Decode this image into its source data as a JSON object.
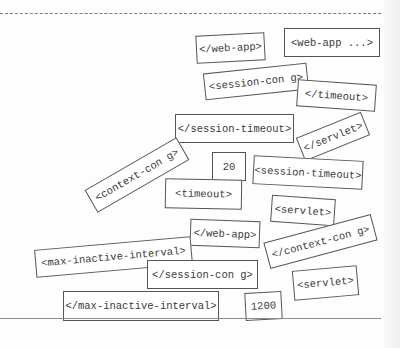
{
  "page": {
    "background": "#fdfdfd",
    "top_divider": "dashed",
    "bottom_divider": "solid"
  },
  "magnets": [
    {
      "id": "m1",
      "label": "</web-app>",
      "x": 196,
      "y": 34,
      "w": 69,
      "h": 28,
      "rotate": -3
    },
    {
      "id": "m2",
      "label": "<web-app ...>",
      "x": 284,
      "y": 28,
      "w": 96,
      "h": 29,
      "rotate": 0
    },
    {
      "id": "m3",
      "label": "<session-con g>",
      "x": 204,
      "y": 68,
      "w": 104,
      "h": 27,
      "rotate": -6
    },
    {
      "id": "m4",
      "label": "</timeout>",
      "x": 297,
      "y": 82,
      "w": 79,
      "h": 27,
      "rotate": 4
    },
    {
      "id": "m5",
      "label": "</session-timeout>",
      "x": 175,
      "y": 114,
      "w": 119,
      "h": 29,
      "rotate": 0
    },
    {
      "id": "m6",
      "label": "</servlet>",
      "x": 298,
      "y": 124,
      "w": 70,
      "h": 25,
      "rotate": -22
    },
    {
      "id": "m7",
      "label": "<context-con g>",
      "x": 84,
      "y": 162,
      "w": 106,
      "h": 26,
      "rotate": -30
    },
    {
      "id": "m8",
      "label": "20",
      "x": 212,
      "y": 152,
      "w": 34,
      "h": 29,
      "rotate": 0
    },
    {
      "id": "m9",
      "label": "<session-timeout>",
      "x": 253,
      "y": 158,
      "w": 110,
      "h": 29,
      "rotate": 3
    },
    {
      "id": "m10",
      "label": "<timeout>",
      "x": 165,
      "y": 179,
      "w": 77,
      "h": 30,
      "rotate": 1
    },
    {
      "id": "m11",
      "label": "<servlet>",
      "x": 271,
      "y": 197,
      "w": 64,
      "h": 27,
      "rotate": 4
    },
    {
      "id": "m12",
      "label": "</web-app>",
      "x": 190,
      "y": 220,
      "w": 70,
      "h": 27,
      "rotate": 2
    },
    {
      "id": "m13",
      "label": "</context-con g>",
      "x": 265,
      "y": 228,
      "w": 111,
      "h": 27,
      "rotate": -15
    },
    {
      "id": "m14",
      "label": "<max-inactive-interval>",
      "x": 35,
      "y": 243,
      "w": 157,
      "h": 28,
      "rotate": -5
    },
    {
      "id": "m15",
      "label": "</session-con g>",
      "x": 147,
      "y": 260,
      "w": 111,
      "h": 29,
      "rotate": 0
    },
    {
      "id": "m16",
      "label": "<servlet>",
      "x": 293,
      "y": 268,
      "w": 65,
      "h": 30,
      "rotate": -5
    },
    {
      "id": "m17",
      "label": "</max-inactive-interval>",
      "x": 63,
      "y": 291,
      "w": 156,
      "h": 30,
      "rotate": 0
    },
    {
      "id": "m18",
      "label": "1200",
      "x": 245,
      "y": 292,
      "w": 37,
      "h": 28,
      "rotate": -3
    }
  ]
}
